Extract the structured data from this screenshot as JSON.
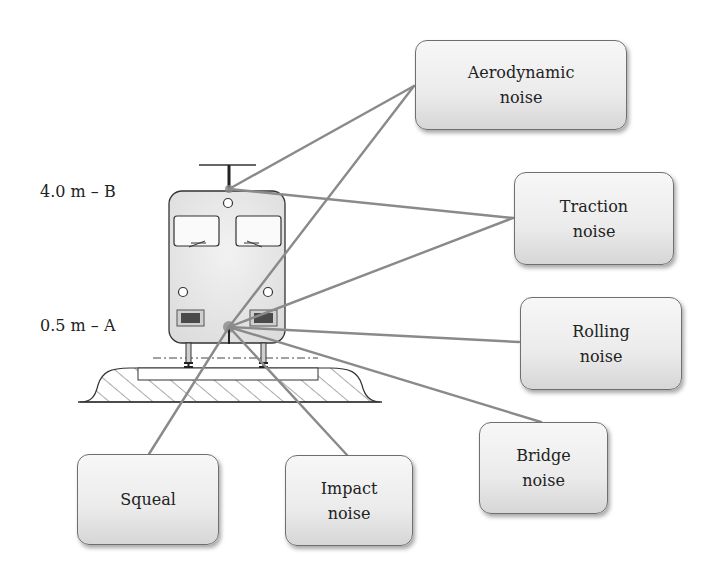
{
  "diagram": {
    "height_labels": [
      {
        "id": "B",
        "text": "4.0 m – B",
        "x": 40,
        "y": 182
      },
      {
        "id": "A",
        "text": "0.5 m – A",
        "x": 40,
        "y": 316
      }
    ],
    "source_points": {
      "B": {
        "x": 229,
        "y": 189
      },
      "A": {
        "x": 229,
        "y": 327
      }
    },
    "boxes": [
      {
        "id": "aerodynamic",
        "label": "Aerodynamic\nnoise",
        "x": 415,
        "y": 40,
        "w": 212,
        "h": 90,
        "anchor": [
          414,
          86
        ]
      },
      {
        "id": "traction",
        "label": "Traction\nnoise",
        "x": 514,
        "y": 172,
        "w": 160,
        "h": 93,
        "anchor": [
          513,
          218
        ]
      },
      {
        "id": "rolling",
        "label": "Rolling\nnoise",
        "x": 520,
        "y": 297,
        "w": 162,
        "h": 93,
        "anchor": [
          519,
          342
        ]
      },
      {
        "id": "bridge",
        "label": "Bridge\nnoise",
        "x": 479,
        "y": 422,
        "w": 129,
        "h": 92,
        "anchor": [
          541,
          422
        ]
      },
      {
        "id": "squeal",
        "label": "Squeal",
        "x": 77,
        "y": 454,
        "w": 142,
        "h": 91,
        "anchor": [
          149,
          454
        ]
      },
      {
        "id": "impact",
        "label": "Impact\nnoise",
        "x": 285,
        "y": 455,
        "w": 128,
        "h": 91,
        "anchor": [
          347,
          455
        ]
      }
    ],
    "connectors": [
      {
        "from": "B",
        "to": "aerodynamic"
      },
      {
        "from": "A",
        "to": "aerodynamic"
      },
      {
        "from": "B",
        "to": "traction"
      },
      {
        "from": "A",
        "to": "traction"
      },
      {
        "from": "A",
        "to": "rolling"
      },
      {
        "from": "A",
        "to": "bridge"
      },
      {
        "from": "A",
        "to": "squeal"
      },
      {
        "from": "A",
        "to": "impact"
      }
    ],
    "colors": {
      "connector": "#8a8a8a",
      "train_body": "#ececec",
      "outline": "#333333",
      "headlight": "#555555",
      "hatch": "#555555"
    }
  }
}
